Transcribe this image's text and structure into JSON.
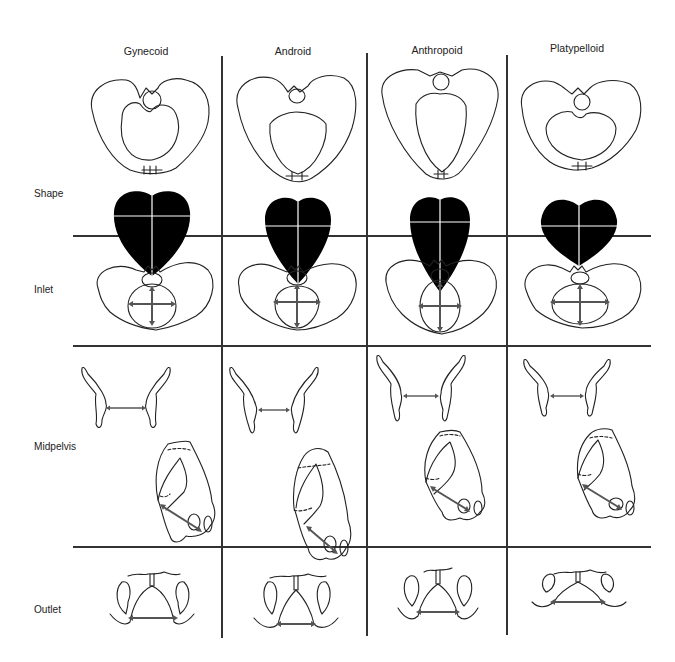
{
  "diagram": {
    "columns": [
      {
        "id": "gynecoid",
        "label": "Gynecoid"
      },
      {
        "id": "android",
        "label": "Android"
      },
      {
        "id": "anthropoid",
        "label": "Anthropoid"
      },
      {
        "id": "platypelloid",
        "label": "Platypelloid"
      }
    ],
    "rows": [
      {
        "id": "shape",
        "label": "Shape"
      },
      {
        "id": "inlet",
        "label": "Inlet"
      },
      {
        "id": "midpelvis",
        "label": "Midpelvis"
      },
      {
        "id": "outlet",
        "label": "Outlet"
      }
    ],
    "colors": {
      "line": "#333333",
      "fill_shape": "#000000",
      "arrow": "#555555",
      "background": "#ffffff"
    }
  }
}
